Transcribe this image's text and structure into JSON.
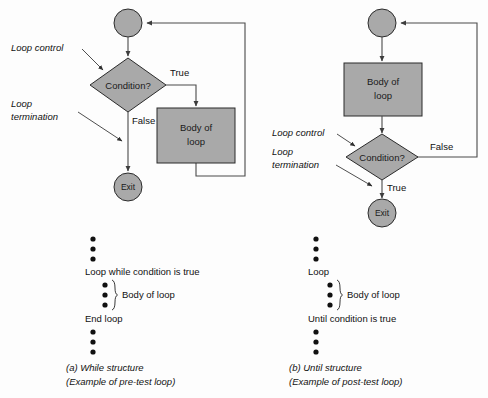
{
  "figure": {
    "background": "#fdfdfd",
    "shape_fill": "#a9a9a9",
    "shape_stroke": "#2b2b2b",
    "connector_color": "#4a4a4a"
  },
  "diagram_a": {
    "id": "while-structure",
    "nodes": {
      "start": "",
      "condition": "Condition?",
      "body": {
        "line1": "Body of",
        "line2": "loop"
      },
      "exit": "Exit"
    },
    "edge_labels": {
      "true": "True",
      "false": "False"
    },
    "annotations": {
      "loop_control": "Loop control",
      "loop_termination_line1": "Loop",
      "loop_termination_line2": "termination"
    },
    "pseudocode": {
      "leading_dots": 3,
      "line1": "Loop while condition is true",
      "body_dots": 3,
      "body_label": "Body of loop",
      "line2": "End loop",
      "trailing_dots": 3
    },
    "caption": {
      "line1": "(a)  While structure",
      "line2": "(Example of pre-test loop)"
    }
  },
  "diagram_b": {
    "id": "until-structure",
    "nodes": {
      "start": "",
      "body": {
        "line1": "Body of",
        "line2": "loop"
      },
      "condition": "Condition?",
      "exit": "Exit"
    },
    "edge_labels": {
      "false": "False",
      "true": "True"
    },
    "annotations": {
      "loop_control": "Loop control",
      "loop_termination_line1": "Loop",
      "loop_termination_line2": "termination"
    },
    "pseudocode": {
      "leading_dots": 3,
      "line1": "Loop",
      "body_dots": 3,
      "body_label": "Body of loop",
      "line2": "Until condition is true",
      "trailing_dots": 3
    },
    "caption": {
      "line1": "(b)  Until structure",
      "line2": "(Example of post-test loop)"
    }
  }
}
